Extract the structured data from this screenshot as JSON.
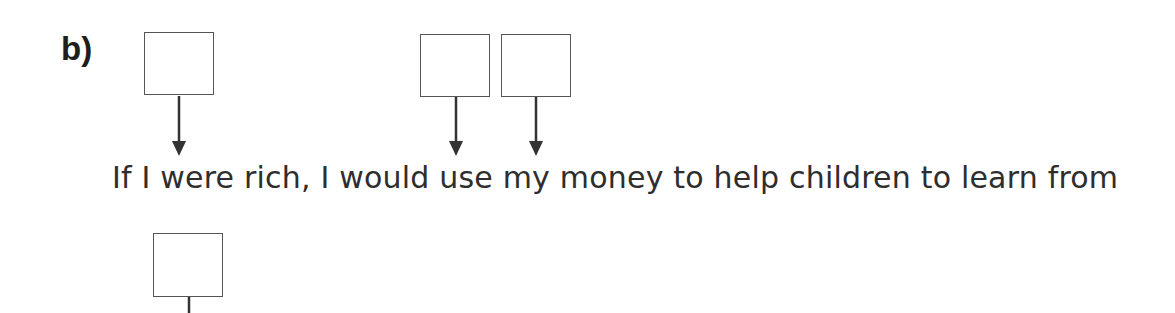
{
  "question": {
    "label": "b)",
    "sentence": "If I were rich, I would use my money to help children to learn from"
  },
  "answer_boxes": [
    {
      "id": 1,
      "position": "above-line-1",
      "points_to": "before 'If'",
      "value": ""
    },
    {
      "id": 2,
      "position": "above-line-1",
      "points_to": "after 'would'",
      "value": ""
    },
    {
      "id": 3,
      "position": "above-line-1",
      "points_to": "after 'use'",
      "value": ""
    },
    {
      "id": 4,
      "position": "below-line-1",
      "points_to": "next line",
      "value": ""
    }
  ],
  "colors": {
    "text": "#2e2e2e",
    "box_border": "#555555",
    "arrow": "#333333"
  }
}
